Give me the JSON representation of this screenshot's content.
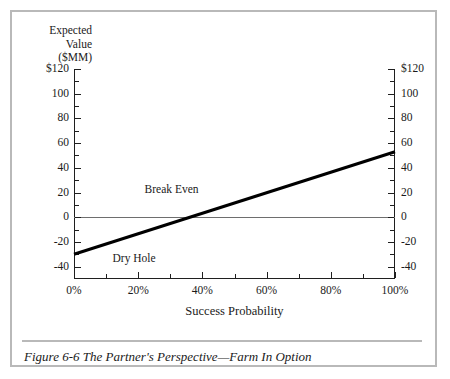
{
  "caption": {
    "text": "Figure 6-6 The Partner's Perspective—Farm In Option"
  },
  "chart_data": {
    "type": "line",
    "title": "",
    "xlabel": "Success Probability",
    "ylabel": "Expected Value ($MM)",
    "ylabel_lines": [
      "Expected",
      "Value",
      "($MM)"
    ],
    "xlim": [
      0,
      100
    ],
    "ylim": [
      -50,
      120
    ],
    "grid": false,
    "legend": "none",
    "x_ticks": [
      0,
      20,
      40,
      60,
      80,
      100
    ],
    "x_tick_labels": [
      "0%",
      "20%",
      "40%",
      "60%",
      "80%",
      "100%"
    ],
    "x_minor_ticks": [
      10,
      30,
      50,
      70,
      90
    ],
    "y_ticks": [
      120,
      100,
      80,
      60,
      40,
      20,
      0,
      -20,
      -40
    ],
    "y_tick_labels": [
      "$120",
      "100",
      "80",
      "60",
      "40",
      "20",
      "0",
      "-20",
      "-40"
    ],
    "y_ticks_right": [
      120,
      100,
      80,
      60,
      40,
      20,
      0,
      -20,
      -40
    ],
    "y_tick_labels_right": [
      "$120",
      "100",
      "80",
      "60",
      "40",
      "20",
      "0",
      "-20",
      "-40"
    ],
    "y_minor_ticks": [
      110,
      90,
      70,
      50,
      30,
      10,
      -10,
      -30
    ],
    "reference_lines": [
      {
        "name": "zero-line",
        "axis": "y",
        "value": 0,
        "color": "#6e6e6e"
      }
    ],
    "series": [
      {
        "name": "Expected Value",
        "color": "#000000",
        "width": 3,
        "x": [
          0,
          100
        ],
        "values": [
          -30,
          53
        ]
      }
    ],
    "annotations": [
      {
        "name": "Break Even",
        "text": "Break Even",
        "x": 22,
        "y": 22
      },
      {
        "name": "Dry Hole",
        "text": "Dry Hole",
        "x": 12,
        "y": -34
      }
    ],
    "break_even_x": 36.1
  },
  "colors": {
    "frame": "#b9b9b9",
    "axis": "#1f1f1f",
    "series": "#000000",
    "zero_line": "#6e6e6e",
    "text": "#1a1a1a",
    "background": "#ffffff"
  }
}
